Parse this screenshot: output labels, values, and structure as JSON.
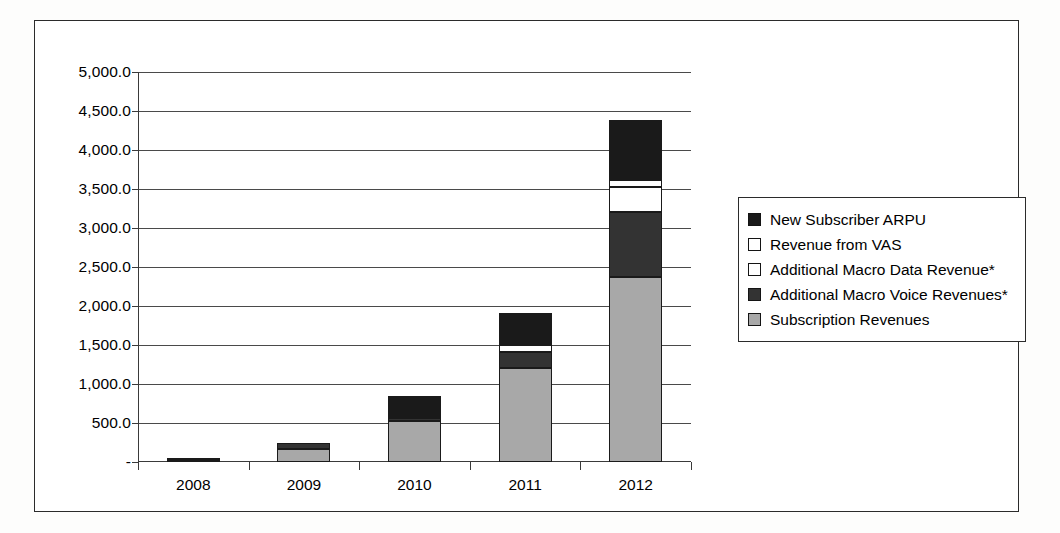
{
  "chart_data": {
    "type": "bar",
    "subtype": "stacked-bar",
    "title": "",
    "xlabel": "",
    "ylabel": "",
    "categories": [
      "2008",
      "2009",
      "2010",
      "2011",
      "2012"
    ],
    "ylim": [
      0,
      5000
    ],
    "ytick_step": 500,
    "ytick_labels": [
      "5,000.0",
      "4,500.0",
      "4,000.0",
      "3,500.0",
      "3,000.0",
      "2,500.0",
      "2,000.0",
      "1,500.0",
      "1,000.0",
      "500.0",
      "-"
    ],
    "ytick_values": [
      5000,
      4500,
      4000,
      3500,
      3000,
      2500,
      2000,
      1500,
      1000,
      500,
      0
    ],
    "grid": true,
    "grid_axis": "y",
    "legend_position": "right",
    "stack_order_bottom_to_top": [
      "Subscription Revenues",
      "Additional Macro Voice Revenues*",
      "Additional Macro Data Revenue*",
      "Revenue from VAS",
      "New Subscriber ARPU"
    ],
    "series": [
      {
        "name": "Subscription Revenues",
        "color": "#a8a8a8",
        "values": [
          30,
          170,
          530,
          1200,
          2370
        ]
      },
      {
        "name": "Additional Macro Voice Revenues*",
        "color": "#333333",
        "values": [
          25,
          80,
          40,
          210,
          840
        ]
      },
      {
        "name": "Additional Macro Data Revenue*",
        "color": "#ffffff",
        "values": [
          0,
          0,
          20,
          90,
          310
        ]
      },
      {
        "name": "Revenue from VAS",
        "color": "#ffffff",
        "values": [
          0,
          0,
          0,
          30,
          100
        ]
      },
      {
        "name": "New Subscriber ARPU",
        "color": "#1a1a1a",
        "values": [
          0,
          0,
          250,
          380,
          770
        ]
      }
    ],
    "totals": [
      55,
      250,
      840,
      1910,
      4390
    ],
    "legend_entries": [
      {
        "label": "New Subscriber ARPU",
        "color": "#1a1a1a"
      },
      {
        "label": "Revenue from VAS",
        "color": "#ffffff"
      },
      {
        "label": "Additional Macro Data Revenue*",
        "color": "#ffffff"
      },
      {
        "label": "Additional Macro Voice Revenues*",
        "color": "#333333"
      },
      {
        "label": "Subscription Revenues",
        "color": "#a8a8a8"
      }
    ]
  }
}
